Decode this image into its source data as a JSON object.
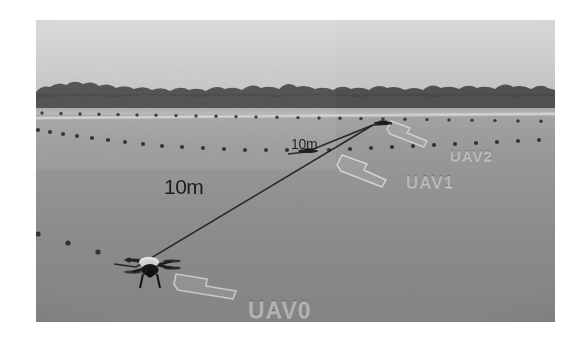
{
  "figure": {
    "kind": "photograph",
    "scene": "outdoor grass field with distant treeline and overcast sky",
    "caption_ghost": "",
    "background_color": "#ffffff"
  },
  "photo": {
    "sky_color": "#d2d2d2",
    "treeline_color": "#3a3a3a",
    "grass_color": "#939393",
    "path_line_color": "#dedede"
  },
  "annotations": {
    "distances": [
      {
        "id": "leg-long",
        "label": "10m"
      },
      {
        "id": "leg-short",
        "label": "10m"
      }
    ],
    "uavs": [
      {
        "id": "uav0",
        "label": "UAV0"
      },
      {
        "id": "uav1",
        "label": "UAV1"
      },
      {
        "id": "uav2",
        "label": "UAV2"
      }
    ],
    "arrow_color": "#b9b9b9",
    "measure_line_color": "#2b2b2b"
  },
  "markers": {
    "row_near_count": 26,
    "row_far_count": 30,
    "marker_color": "#333333"
  }
}
